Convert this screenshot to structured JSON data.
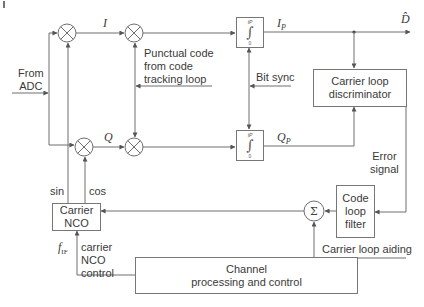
{
  "figure": {
    "corner_mark": "|",
    "input_label": [
      "From",
      "ADC"
    ],
    "mixers": [
      {
        "id": "mixer-i-carrier",
        "symbol": "⊗"
      },
      {
        "id": "mixer-i-code",
        "symbol": "⊗"
      },
      {
        "id": "mixer-q-carrier",
        "symbol": "⊗"
      },
      {
        "id": "mixer-q-code",
        "symbol": "⊗"
      }
    ],
    "signals": {
      "i": "I",
      "q": "Q",
      "ip": "I",
      "ip_sub": "P",
      "qp": "Q",
      "qp_sub": "P",
      "d_hat": "D̂"
    },
    "punctual_code_label": [
      "Punctual code",
      "from code",
      "tracking loop"
    ],
    "bit_sync_label": "Bit sync",
    "integrator": {
      "upper": "t_P",
      "upper_text": "tP",
      "symbol": "∫",
      "lower": "0"
    },
    "blocks": {
      "carrier_loop_discriminator": [
        "Carrier loop",
        "discriminator"
      ],
      "carrier_nco": [
        "Carrier",
        "NCO"
      ],
      "code_loop_filter": [
        "Code",
        "loop",
        "filter"
      ],
      "channel_processing": [
        "Channel",
        "processing and control"
      ],
      "summer": "Σ"
    },
    "nco_outputs": {
      "sin": "sin",
      "cos": "cos"
    },
    "error_signal_label": [
      "Error",
      "signal"
    ],
    "carrier_loop_aiding_label": "Carrier loop aiding",
    "nco_control": {
      "f_if": "f",
      "f_if_sub": "IF",
      "label": [
        "carrier",
        "NCO",
        "control"
      ]
    },
    "colors": {
      "line": "#6e6e6e",
      "box_border": "#777777",
      "text": "#3a3a3a",
      "background": "#ffffff"
    }
  }
}
